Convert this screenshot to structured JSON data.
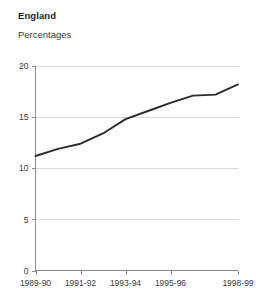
{
  "chart": {
    "title": "England",
    "subtitle": "Percentages"
  },
  "chart_data": {
    "type": "line",
    "title": "England",
    "subtitle": "Percentages",
    "xlabel": "",
    "ylabel": "Percentages",
    "grid": true,
    "legend": false,
    "ylim": [
      0,
      20
    ],
    "yticks": [
      0,
      5,
      10,
      15,
      20
    ],
    "ytick_labels": [
      "0",
      "5",
      "10",
      "15",
      "20"
    ],
    "categories": [
      "1989-90",
      "1990-91",
      "1991-92",
      "1992-93",
      "1993-94",
      "1994-95",
      "1995-96",
      "1996-97",
      "1997-98",
      "1998-99"
    ],
    "xtick_labels": [
      "1989-90",
      "1991-92",
      "1993-94",
      "1995-96",
      "1998-99"
    ],
    "xtick_indices": [
      0,
      2,
      4,
      6,
      9
    ],
    "series": [
      {
        "name": "England",
        "values": [
          11.2,
          11.9,
          12.4,
          13.4,
          14.8,
          15.6,
          16.4,
          17.1,
          17.2,
          18.2
        ]
      }
    ],
    "colors": {
      "line": "#2b2b2b",
      "grid": "#d8d8d8",
      "axis": "#8a8a8a",
      "background": "#ffffff",
      "text": "#3a3a3a"
    }
  }
}
